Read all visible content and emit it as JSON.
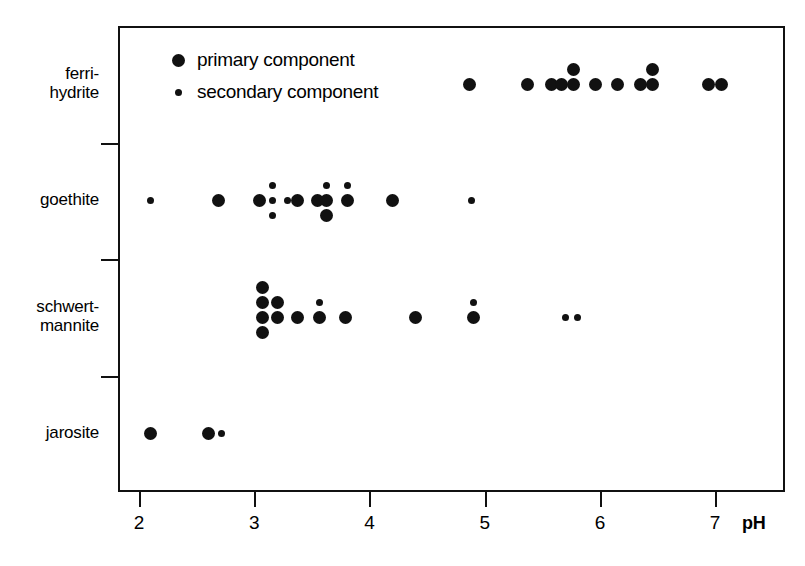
{
  "chart_data": {
    "type": "scatter",
    "title": "",
    "xlabel": "pH",
    "ylabel": "",
    "xlim": [
      1.82,
      7.61
    ],
    "ylim": [
      0,
      4
    ],
    "grid": false,
    "legend_position": "top-left",
    "x_ticks": [
      {
        "value": 2,
        "label": "2"
      },
      {
        "value": 3,
        "label": "3"
      },
      {
        "value": 4,
        "label": "4"
      },
      {
        "value": 5,
        "label": "5"
      },
      {
        "value": 6,
        "label": "6"
      },
      {
        "value": 7,
        "label": "7"
      }
    ],
    "categories": [
      {
        "label": "ferri-\nhydrite",
        "name": "ferrihydrite",
        "row": 0
      },
      {
        "label": "goethite",
        "name": "goethite",
        "row": 1
      },
      {
        "label": "schwert-\nmannite",
        "name": "schwertmannite",
        "row": 2
      },
      {
        "label": "jarosite",
        "name": "jarosite",
        "row": 3
      }
    ],
    "legend": [
      {
        "key": "primary",
        "label": "primary component",
        "marker": "large-filled-circle"
      },
      {
        "key": "secondary",
        "label": "secondary component",
        "marker": "small-filled-circle"
      }
    ],
    "series": [
      {
        "name": "ferrihydrite",
        "row": 0,
        "points": [
          {
            "ph": 4.87,
            "kind": "primary",
            "offset": 0
          },
          {
            "ph": 5.37,
            "kind": "primary",
            "offset": 0
          },
          {
            "ph": 5.58,
            "kind": "primary",
            "offset": 0
          },
          {
            "ph": 5.67,
            "kind": "primary",
            "offset": 0
          },
          {
            "ph": 5.77,
            "kind": "primary",
            "offset": 0
          },
          {
            "ph": 5.77,
            "kind": "primary",
            "offset": -1
          },
          {
            "ph": 5.96,
            "kind": "primary",
            "offset": 0
          },
          {
            "ph": 6.15,
            "kind": "primary",
            "offset": 0
          },
          {
            "ph": 6.35,
            "kind": "primary",
            "offset": 0
          },
          {
            "ph": 6.46,
            "kind": "primary",
            "offset": 0
          },
          {
            "ph": 6.46,
            "kind": "primary",
            "offset": -1
          },
          {
            "ph": 6.94,
            "kind": "primary",
            "offset": 0
          },
          {
            "ph": 7.06,
            "kind": "primary",
            "offset": 0
          }
        ]
      },
      {
        "name": "goethite",
        "row": 1,
        "points": [
          {
            "ph": 2.1,
            "kind": "secondary",
            "offset": 0
          },
          {
            "ph": 2.69,
            "kind": "primary",
            "offset": 0
          },
          {
            "ph": 3.05,
            "kind": "primary",
            "offset": 0
          },
          {
            "ph": 3.16,
            "kind": "secondary",
            "offset": 0
          },
          {
            "ph": 3.16,
            "kind": "secondary",
            "offset": -1
          },
          {
            "ph": 3.16,
            "kind": "secondary",
            "offset": 1
          },
          {
            "ph": 3.29,
            "kind": "secondary",
            "offset": 0
          },
          {
            "ph": 3.38,
            "kind": "primary",
            "offset": 0
          },
          {
            "ph": 3.55,
            "kind": "primary",
            "offset": 0
          },
          {
            "ph": 3.63,
            "kind": "secondary",
            "offset": -1
          },
          {
            "ph": 3.63,
            "kind": "primary",
            "offset": 0
          },
          {
            "ph": 3.63,
            "kind": "primary",
            "offset": 1
          },
          {
            "ph": 3.81,
            "kind": "secondary",
            "offset": -1
          },
          {
            "ph": 3.81,
            "kind": "primary",
            "offset": 0
          },
          {
            "ph": 4.2,
            "kind": "primary",
            "offset": 0
          },
          {
            "ph": 4.89,
            "kind": "secondary",
            "offset": 0
          }
        ]
      },
      {
        "name": "schwertmannite",
        "row": 2,
        "points": [
          {
            "ph": 3.07,
            "kind": "primary",
            "offset": -2
          },
          {
            "ph": 3.07,
            "kind": "primary",
            "offset": -1
          },
          {
            "ph": 3.07,
            "kind": "primary",
            "offset": 0
          },
          {
            "ph": 3.07,
            "kind": "primary",
            "offset": 1
          },
          {
            "ph": 3.2,
            "kind": "primary",
            "offset": -1
          },
          {
            "ph": 3.2,
            "kind": "primary",
            "offset": 0
          },
          {
            "ph": 3.38,
            "kind": "primary",
            "offset": 0
          },
          {
            "ph": 3.57,
            "kind": "secondary",
            "offset": -1
          },
          {
            "ph": 3.57,
            "kind": "primary",
            "offset": 0
          },
          {
            "ph": 3.79,
            "kind": "primary",
            "offset": 0
          },
          {
            "ph": 4.4,
            "kind": "primary",
            "offset": 0
          },
          {
            "ph": 4.9,
            "kind": "secondary",
            "offset": -1
          },
          {
            "ph": 4.9,
            "kind": "primary",
            "offset": 0
          },
          {
            "ph": 5.7,
            "kind": "secondary",
            "offset": 0
          },
          {
            "ph": 5.81,
            "kind": "secondary",
            "offset": 0
          }
        ]
      },
      {
        "name": "jarosite",
        "row": 3,
        "points": [
          {
            "ph": 2.1,
            "kind": "primary",
            "offset": 0
          },
          {
            "ph": 2.6,
            "kind": "primary",
            "offset": 0
          },
          {
            "ph": 2.72,
            "kind": "secondary",
            "offset": 0
          }
        ]
      }
    ]
  }
}
